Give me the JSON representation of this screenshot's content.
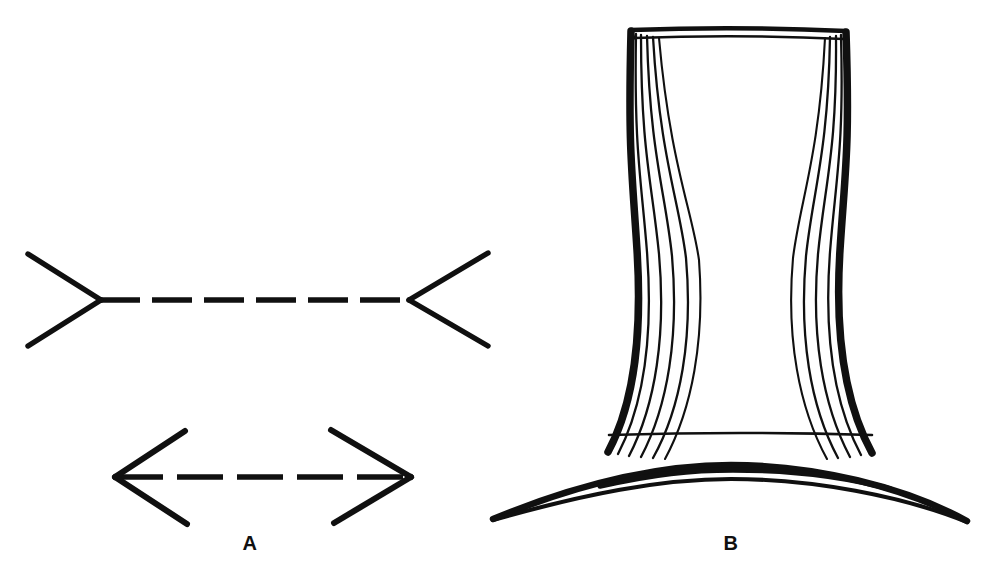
{
  "plate": {
    "title": "Two classic geometric optical illusions",
    "background_color": "#ffffff",
    "ink_color": "#101010",
    "width": 983,
    "height": 586
  },
  "panels": [
    {
      "label": "A",
      "name": "muller-lyer-illusion",
      "caption_position": {
        "x": 230,
        "y": 533
      },
      "figures": [
        {
          "name": "muller-lyer-outward-fins",
          "description": "Dashed horizontal shaft with outward-pointing (arrowhead-away) fins at both ends",
          "shaft": {
            "x1": 100,
            "y1": 300,
            "x2": 410,
            "y2": 300,
            "dash_count": 6,
            "dash_pattern": "40 12",
            "stroke_width": 5
          },
          "fins": [
            {
              "from": [
                100,
                300
              ],
              "to": [
                28,
                255
              ]
            },
            {
              "from": [
                100,
                300
              ],
              "to": [
                28,
                345
              ]
            },
            {
              "from": [
                410,
                300
              ],
              "to": [
                487,
                254
              ]
            },
            {
              "from": [
                410,
                300
              ],
              "to": [
                487,
                345
              ]
            }
          ]
        },
        {
          "name": "muller-lyer-inward-fins",
          "description": "Dashed horizontal shaft with inward-pointing (arrowhead-toward) fins at both ends",
          "shaft": {
            "x1": 116,
            "y1": 477,
            "x2": 409,
            "y2": 477,
            "dash_count": 5,
            "dash_pattern": "46 14",
            "stroke_width": 5
          },
          "fins": [
            {
              "from": [
                116,
                477
              ],
              "to": [
                184,
                432
              ]
            },
            {
              "from": [
                116,
                477
              ],
              "to": [
                186,
                524
              ]
            },
            {
              "from": [
                409,
                477
              ],
              "to": [
                331,
                431
              ]
            },
            {
              "from": [
                409,
                477
              ],
              "to": [
                334,
                523
              ]
            }
          ]
        }
      ]
    },
    {
      "label": "B",
      "name": "top-hat-illusion",
      "caption_position": {
        "x": 711,
        "y": 533
      },
      "figures": [
        {
          "name": "hat-crown",
          "description": "Tall top-hat crown, concave sides, widening toward the base",
          "top_rim": {
            "left_x": 632,
            "right_x": 846,
            "y_outer": 29,
            "y_inner": 37
          },
          "base_y": 455,
          "base_left_x": 594,
          "base_right_x": 884,
          "waist_y": 250,
          "waist_left_x": 640,
          "waist_right_x": 829
        },
        {
          "name": "hat-band",
          "description": "Horizontal hatband line crossing the crown near its base",
          "y": 434,
          "left_x": 609,
          "right_x": 872
        },
        {
          "name": "hat-brim",
          "description": "Wide upward-curving brim crescent beneath the crown",
          "left_tip": [
            493,
            519
          ],
          "right_tip": [
            967,
            521
          ],
          "apex_y": 468,
          "thickness": 13
        }
      ]
    }
  ],
  "labels": {
    "a": "A",
    "b": "B"
  }
}
